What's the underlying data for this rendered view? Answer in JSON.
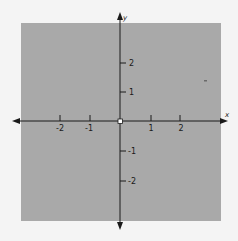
{
  "diagram": {
    "type": "coordinate-plane",
    "shaded_region_color": "#a9a9a9",
    "background_color": "#f4f4f4",
    "axis_color": "#1a1a1a",
    "x_axis_label": "x",
    "y_axis_label": "y",
    "x_ticks": [
      {
        "value": -2,
        "label": "-2"
      },
      {
        "value": -1,
        "label": "-1"
      },
      {
        "value": 1,
        "label": "1"
      },
      {
        "value": 2,
        "label": "2"
      }
    ],
    "y_ticks": [
      {
        "value": 2,
        "label": "2"
      },
      {
        "value": 1,
        "label": "1"
      },
      {
        "value": -1,
        "label": "-1"
      },
      {
        "value": -2,
        "label": "-2"
      }
    ],
    "origin_marker": "open-circle",
    "shaded_region": "entire plane except origin"
  }
}
